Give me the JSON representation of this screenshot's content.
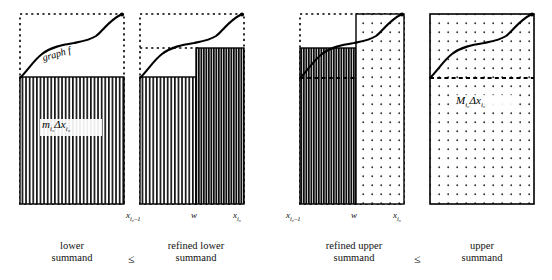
{
  "figure": {
    "type": "math-diagram",
    "topic": "refinement of lower and upper Darboux sums",
    "graph_label": "graph f"
  },
  "panels": [
    {
      "id": "lower-summand",
      "caption_line1": "lower",
      "caption_line2": "summand",
      "area_label": "mₗ₀Δxₗ₀",
      "area_label_parts": {
        "m": "m",
        "msub": "i₀",
        "delta": "Δx",
        "dsub": "i₀"
      },
      "fill": "vertical-hatch-light",
      "bar_top_fraction": 0.33,
      "has_dashed_box": true
    },
    {
      "id": "refined-lower-summand",
      "caption_line1": "refined lower",
      "caption_line2": "summand",
      "fill_left": "vertical-hatch-light",
      "fill_right": "vertical-hatch-dark",
      "left_top_fraction": 0.33,
      "right_top_fraction": 0.72,
      "split_fraction": 0.55,
      "has_dashed_box": true
    },
    {
      "id": "refined-upper-summand",
      "caption_line1": "refined upper",
      "caption_line2": "summand",
      "fill_left": "vertical-hatch-dark",
      "fill_right": "dotted",
      "left_top_fraction": 0.72,
      "right_top_fraction": 1.0,
      "split_fraction": 0.55,
      "has_dashed_box": true,
      "has_dashed_baseline": true
    },
    {
      "id": "upper-summand",
      "caption_line1": "upper",
      "caption_line2": "summand",
      "area_label": "Mₗ₀Δxₗ₀",
      "area_label_parts": {
        "m": "M",
        "msub": "i₀",
        "delta": "Δx",
        "dsub": "i₀"
      },
      "fill": "dotted",
      "bar_top_fraction": 1.0,
      "has_dashed_baseline": true
    }
  ],
  "axis_labels": {
    "left": {
      "base": "x",
      "sub": "i₀–1"
    },
    "middle": {
      "base": "w",
      "sub": ""
    },
    "right": {
      "base": "x",
      "sub": "i₀"
    }
  },
  "relations": {
    "first": "≤",
    "second": "≤",
    "third": "≤"
  },
  "colors": {
    "stroke": "#000000",
    "hatch_light": "#1a1a1a",
    "hatch_dark": "#111111",
    "dot": "#3a3a3a",
    "background": "#ffffff"
  }
}
